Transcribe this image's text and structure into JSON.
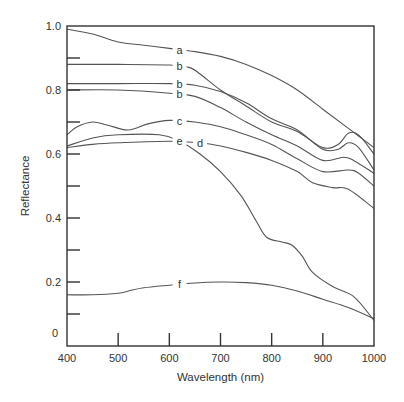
{
  "chart_data": {
    "type": "line",
    "title": "",
    "xlabel": "Wavelength (nm)",
    "ylabel": "Reflectance",
    "xlim": [
      400,
      1000
    ],
    "ylim": [
      0,
      1.0
    ],
    "grid": false,
    "legend": "inline curve labels",
    "x_ticks": [
      400,
      500,
      600,
      700,
      800,
      900,
      1000
    ],
    "x_tick_labels": [
      "400",
      "500",
      "600",
      "700",
      "800",
      "900",
      "1000"
    ],
    "y_ticks": [
      0,
      0.1,
      0.2,
      0.3,
      0.4,
      0.5,
      0.6,
      0.7,
      0.8,
      0.9,
      1.0
    ],
    "y_tick_labels": [
      {
        "value": 0,
        "label": "0"
      },
      {
        "value": 0.2,
        "label": "0.2"
      },
      {
        "value": 0.4,
        "label": "0.4"
      },
      {
        "value": 0.6,
        "label": "0.6"
      },
      {
        "value": 0.8,
        "label": "0.8"
      },
      {
        "value": 1.0,
        "label": "1.0"
      }
    ],
    "series": [
      {
        "name": "a",
        "label_at": 620,
        "x": [
          400,
          450,
          500,
          550,
          600,
          650,
          700,
          750,
          800,
          850,
          900,
          950,
          1000
        ],
        "y": [
          0.99,
          0.975,
          0.95,
          0.94,
          0.93,
          0.92,
          0.905,
          0.88,
          0.845,
          0.8,
          0.74,
          0.68,
          0.62
        ]
      },
      {
        "name": "b",
        "label_at": 620,
        "x": [
          400,
          500,
          600,
          640,
          660,
          700,
          750,
          800,
          850,
          900,
          930,
          950,
          970,
          1000
        ],
        "y": [
          0.88,
          0.88,
          0.878,
          0.87,
          0.85,
          0.8,
          0.75,
          0.7,
          0.67,
          0.62,
          0.63,
          0.665,
          0.66,
          0.6
        ]
      },
      {
        "name": "b",
        "label_at": 620,
        "x": [
          400,
          500,
          600,
          650,
          700,
          750,
          800,
          850,
          900,
          930,
          950,
          970,
          1000
        ],
        "y": [
          0.82,
          0.82,
          0.82,
          0.815,
          0.795,
          0.76,
          0.71,
          0.675,
          0.615,
          0.615,
          0.635,
          0.62,
          0.55
        ]
      },
      {
        "name": "b",
        "label_at": 620,
        "x": [
          400,
          500,
          600,
          650,
          700,
          750,
          800,
          850,
          900,
          940,
          960,
          1000
        ],
        "y": [
          0.8,
          0.8,
          0.79,
          0.78,
          0.745,
          0.7,
          0.66,
          0.625,
          0.58,
          0.59,
          0.58,
          0.54
        ]
      },
      {
        "name": "c",
        "label_at": 620,
        "x": [
          400,
          420,
          450,
          480,
          520,
          560,
          600,
          650,
          700,
          750,
          800,
          850,
          900,
          950,
          970,
          1000
        ],
        "y": [
          0.66,
          0.685,
          0.7,
          0.69,
          0.675,
          0.695,
          0.705,
          0.7,
          0.685,
          0.66,
          0.63,
          0.585,
          0.545,
          0.55,
          0.54,
          0.5
        ]
      },
      {
        "name": "d",
        "label_at": 660,
        "x": [
          400,
          450,
          500,
          600,
          660,
          700,
          750,
          800,
          850,
          880,
          920,
          950,
          1000
        ],
        "y": [
          0.62,
          0.63,
          0.635,
          0.64,
          0.635,
          0.625,
          0.605,
          0.58,
          0.545,
          0.51,
          0.495,
          0.49,
          0.43
        ]
      },
      {
        "name": "e",
        "label_at": 620,
        "x": [
          400,
          450,
          500,
          580,
          620,
          660,
          700,
          740,
          770,
          790,
          820,
          840,
          860,
          880,
          920,
          960,
          1000
        ],
        "y": [
          0.625,
          0.65,
          0.66,
          0.66,
          0.64,
          0.6,
          0.545,
          0.47,
          0.39,
          0.34,
          0.325,
          0.315,
          0.28,
          0.23,
          0.185,
          0.155,
          0.08
        ]
      },
      {
        "name": "f",
        "label_at": 620,
        "x": [
          400,
          450,
          500,
          520,
          550,
          600,
          650,
          700,
          750,
          800,
          850,
          900,
          950,
          1000
        ],
        "y": [
          0.16,
          0.16,
          0.165,
          0.172,
          0.182,
          0.19,
          0.197,
          0.2,
          0.198,
          0.19,
          0.172,
          0.146,
          0.12,
          0.085
        ]
      }
    ]
  }
}
